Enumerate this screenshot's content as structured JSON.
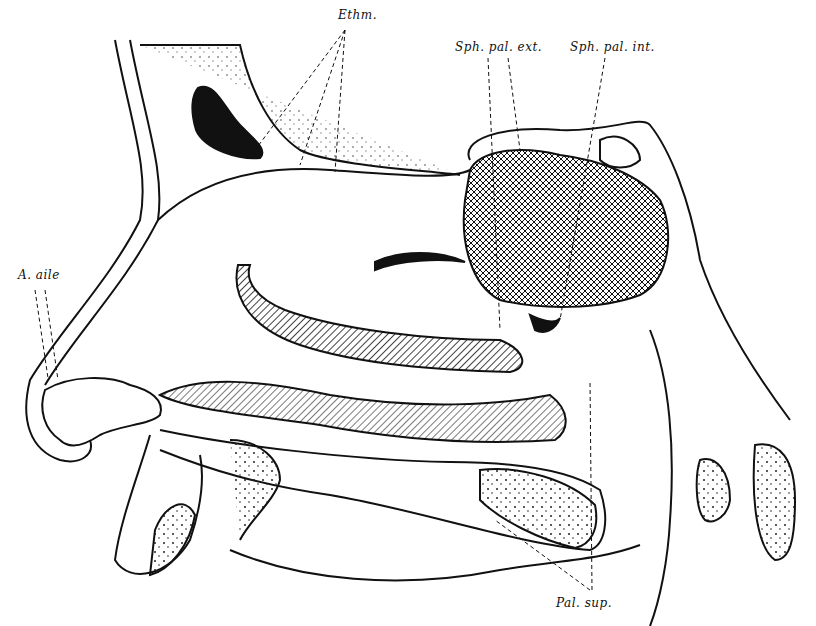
{
  "figure": {
    "type": "anatomical illustration",
    "labels": [
      {
        "id": "ethm",
        "text": "Ethm.",
        "x": 338,
        "y": 8
      },
      {
        "id": "sph_pal_ext",
        "text": "Sph. pal. ext.",
        "x": 455,
        "y": 40
      },
      {
        "id": "sph_pal_int",
        "text": "Sph. pal. int.",
        "x": 570,
        "y": 40
      },
      {
        "id": "a_aile",
        "text": "A. aile",
        "x": 18,
        "y": 268
      },
      {
        "id": "pal_sup",
        "text": "Pal. sup.",
        "x": 556,
        "y": 596
      }
    ]
  }
}
